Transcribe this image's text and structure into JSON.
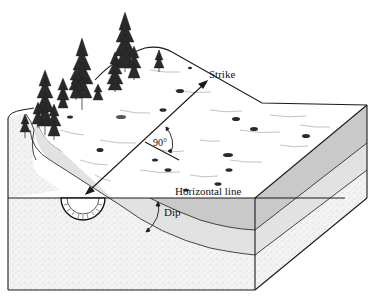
{
  "figure": {
    "labels": {
      "strike": "Strike",
      "right_angle": "90°",
      "horizontal_line": "Horizontal line",
      "dip": "Dip"
    },
    "colors": {
      "outline": "#1a1a1a",
      "surface": "#ffffff",
      "tilted_layer_dark": "#c8c8c8",
      "tilted_layer_light": "#e4e4e4",
      "sandstone": "#f2f2f2",
      "stipple": "#9a9a9a",
      "tree": "#2a2a2a"
    },
    "elements": [
      "block-top-surface",
      "block-front-face",
      "block-right-face",
      "tilted-rock-layer",
      "tree-cluster",
      "shrubs",
      "strike-arrow",
      "perpendicular-line",
      "right-angle-arc",
      "horizontal-line",
      "protractor",
      "dip-arc"
    ]
  }
}
